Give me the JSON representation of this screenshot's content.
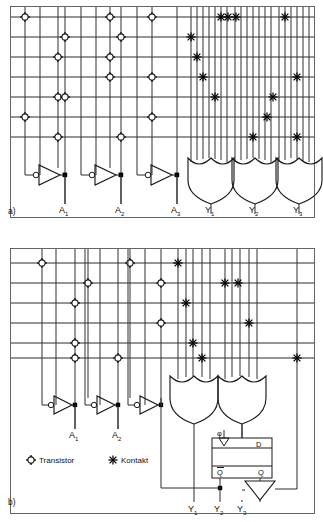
{
  "figure": {
    "background_color": "#ffffff",
    "line_color": "#2b2b2b"
  },
  "legend": {
    "transistor": {
      "label": "Transistor",
      "symbol": "circle-cross"
    },
    "kontakt": {
      "label": "Kontakt",
      "symbol": "asterisk"
    }
  },
  "panels": [
    {
      "id": "a",
      "label": "a)",
      "frame": {
        "x": 10,
        "y": 6,
        "w": 305,
        "h": 212
      },
      "rows": 7,
      "row_ys": [
        17,
        37,
        57,
        77,
        97,
        117,
        137
      ],
      "inputs": [
        {
          "label": "A",
          "sub": "1",
          "x": 65,
          "inv_x": 40,
          "label_x": 62,
          "label_y": 212
        },
        {
          "label": "A",
          "sub": "2",
          "x": 121,
          "inv_x": 96,
          "label_x": 118,
          "label_y": 212
        },
        {
          "label": "A",
          "sub": "3",
          "x": 177,
          "inv_x": 152,
          "label_x": 174,
          "label_y": 212
        }
      ],
      "outputs": [
        {
          "label": "Y",
          "sub": "1",
          "x": 211,
          "label_x": 208,
          "label_y": 212
        },
        {
          "label": "Y",
          "sub": "2",
          "x": 255,
          "label_x": 252,
          "label_y": 212
        },
        {
          "label": "Y",
          "sub": "3",
          "x": 299,
          "label_x": 296,
          "label_y": 212
        }
      ],
      "and_vlines": [
        25,
        40,
        58,
        65,
        96,
        110,
        121,
        152,
        177
      ],
      "or_vlines": [
        191,
        197,
        203,
        209,
        215,
        221,
        235,
        241,
        247,
        253,
        259,
        265,
        279,
        285,
        291,
        297,
        303
      ],
      "transistors": [
        {
          "x": 25,
          "y": 17
        },
        {
          "x": 110,
          "y": 17
        },
        {
          "x": 152,
          "y": 17
        },
        {
          "x": 65,
          "y": 37
        },
        {
          "x": 121,
          "y": 37
        },
        {
          "x": 58,
          "y": 57
        },
        {
          "x": 110,
          "y": 57
        },
        {
          "x": 110,
          "y": 77
        },
        {
          "x": 152,
          "y": 77
        },
        {
          "x": 58,
          "y": 97
        },
        {
          "x": 65,
          "y": 97
        },
        {
          "x": 25,
          "y": 117
        },
        {
          "x": 152,
          "y": 117
        },
        {
          "x": 58,
          "y": 137
        },
        {
          "x": 121,
          "y": 137
        }
      ],
      "kontakte": [
        {
          "x": 221,
          "y": 17
        },
        {
          "x": 227,
          "y": 17
        },
        {
          "x": 235,
          "y": 17
        },
        {
          "x": 285,
          "y": 17
        },
        {
          "x": 191,
          "y": 37
        },
        {
          "x": 197,
          "y": 57
        },
        {
          "x": 203,
          "y": 77
        },
        {
          "x": 297,
          "y": 77
        },
        {
          "x": 215,
          "y": 97
        },
        {
          "x": 273,
          "y": 97
        },
        {
          "x": 267,
          "y": 117
        },
        {
          "x": 253,
          "y": 137
        },
        {
          "x": 297,
          "y": 137
        }
      ],
      "or_gates": [
        {
          "x": 188,
          "y": 158,
          "w": 44,
          "h": 44,
          "out_x": 211
        },
        {
          "x": 232,
          "y": 158,
          "w": 44,
          "h": 44,
          "out_x": 255
        },
        {
          "x": 276,
          "y": 158,
          "w": 44,
          "h": 44,
          "out_x": 299
        }
      ]
    },
    {
      "id": "b",
      "label": "b)",
      "frame": {
        "x": 10,
        "y": 248,
        "w": 305,
        "h": 266
      },
      "rows": 6,
      "row_ys": [
        263,
        283,
        303,
        323,
        343,
        358
      ],
      "inputs": [
        {
          "label": "A",
          "sub": "1",
          "x": 75,
          "label_x": 72,
          "label_y": 437
        },
        {
          "label": "A",
          "sub": "2",
          "x": 118,
          "label_x": 115,
          "label_y": 437
        }
      ],
      "outputs": [
        {
          "label": "Y",
          "sub": "1",
          "x": 192,
          "label_x": 189,
          "label_y": 508
        },
        {
          "label": "Y",
          "sub": "2",
          "x": 218,
          "label_x": 215,
          "label_y": 508
        },
        {
          "label": "Y",
          "sub": "3",
          "x": 241,
          "label_x": 238,
          "label_y": 508
        }
      ],
      "transistors": [
        {
          "x": 42,
          "y": 263
        },
        {
          "x": 130,
          "y": 263
        },
        {
          "x": 88,
          "y": 283
        },
        {
          "x": 161,
          "y": 283
        },
        {
          "x": 75,
          "y": 303
        },
        {
          "x": 161,
          "y": 323
        },
        {
          "x": 75,
          "y": 343
        },
        {
          "x": 75,
          "y": 358
        },
        {
          "x": 118,
          "y": 358
        }
      ],
      "kontakte": [
        {
          "x": 178,
          "y": 263
        },
        {
          "x": 225,
          "y": 283
        },
        {
          "x": 237,
          "y": 283
        },
        {
          "x": 186,
          "y": 303
        },
        {
          "x": 249,
          "y": 323
        },
        {
          "x": 193,
          "y": 343
        },
        {
          "x": 202,
          "y": 358
        },
        {
          "x": 297,
          "y": 358
        }
      ],
      "or_gates": [
        {
          "x": 172,
          "y": 375,
          "w": 46,
          "h": 46,
          "out_x": 195
        },
        {
          "x": 220,
          "y": 375,
          "w": 46,
          "h": 46,
          "out_x": 243
        }
      ],
      "flipflop": {
        "x": 212,
        "y": 438,
        "w": 60,
        "h": 40,
        "clock_label": "φ",
        "d_label": "D",
        "qbar_label": "Q",
        "q_label": "Q"
      },
      "buffer": {
        "x": 232,
        "y": 480,
        "w": 30,
        "h": 22
      }
    }
  ]
}
